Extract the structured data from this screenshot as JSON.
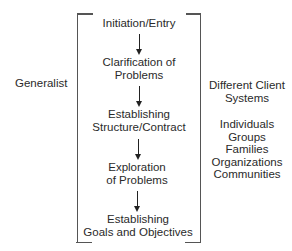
{
  "left_label": "Generalist",
  "stages": [
    {
      "lines": [
        "Initiation/Entry"
      ]
    },
    {
      "lines": [
        "Clarification of",
        "Problems"
      ]
    },
    {
      "lines": [
        "Establishing",
        "Structure/Contract"
      ]
    },
    {
      "lines": [
        "Exploration",
        "of Problems"
      ]
    },
    {
      "lines": [
        "Establishing",
        "Goals and Objectives"
      ]
    }
  ],
  "right_panel": {
    "heading": [
      "Different Client",
      "Systems"
    ],
    "items": [
      "Individuals",
      "Groups",
      "Families",
      "Organizations",
      "Communities"
    ]
  },
  "colors": {
    "text": "#2a2a2a",
    "bracket": "#555555",
    "arrow": "#222222"
  }
}
